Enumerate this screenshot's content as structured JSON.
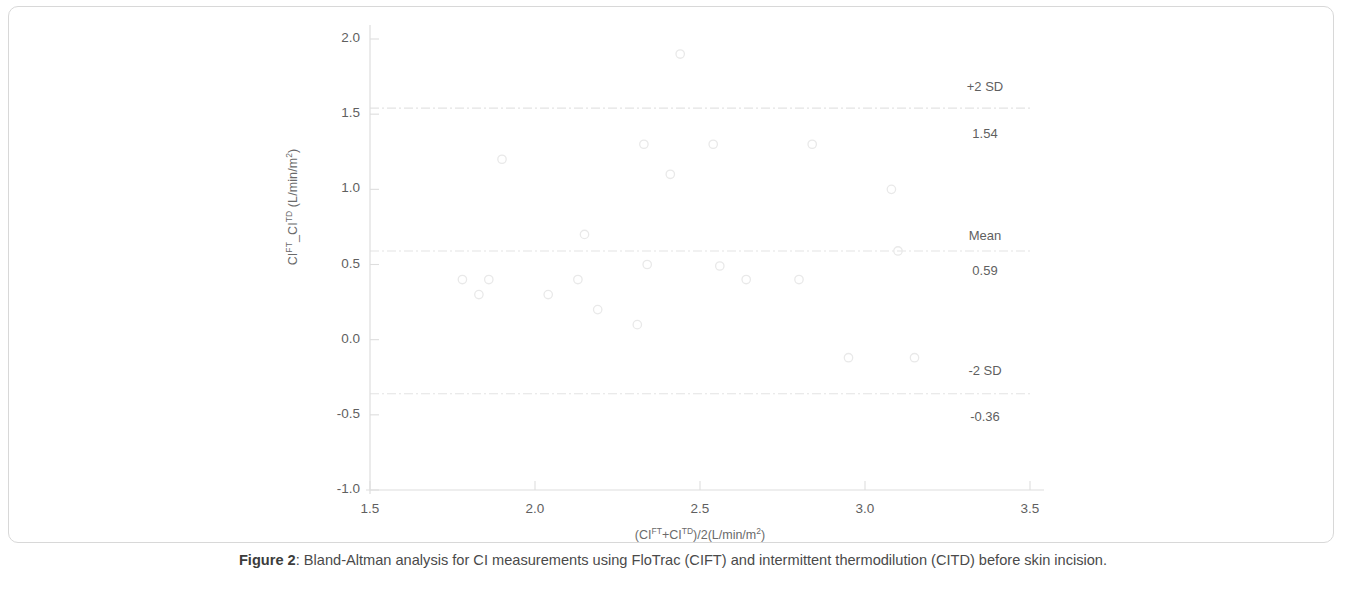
{
  "figure": {
    "caption_bold": "Figure 2",
    "caption_rest": ": Bland-Altman analysis for CI measurements using FloTrac (CIFT) and intermittent thermodilution (CITD) before skin incision."
  },
  "annotations": {
    "upper_label": "+2 SD",
    "upper_value": "1.54",
    "mean_label": "Mean",
    "mean_value": "0.59",
    "lower_label": "-2 SD",
    "lower_value": "-0.36"
  },
  "axis": {
    "y_ticks": [
      "2.0",
      "1.5",
      "1.0",
      "0.5",
      "0.0",
      "-0.5",
      "-1.0"
    ],
    "x_ticks": [
      "1.5",
      "2.0",
      "2.5",
      "3.0",
      "3.5"
    ]
  },
  "colors": {
    "marker_stroke": "#e9e9e9",
    "reference_line": "#e4e4e4",
    "axis_line": "#dedede",
    "text": "#5f5f5f"
  },
  "chart_data": {
    "type": "scatter",
    "title": "",
    "xlabel": "(CIᵀᵀ+CIᵀᴰ)/2(L/min/m2)",
    "xlabel_parts": [
      "(CI",
      "FT",
      "+CI",
      "TD",
      ")/2(L/min/m",
      "2",
      ")"
    ],
    "ylabel_parts": [
      "CI",
      "FT",
      "_CI",
      "TD",
      " (L/min/m",
      "2",
      ")"
    ],
    "xlim": [
      1.5,
      3.5
    ],
    "ylim": [
      -1.0,
      2.0
    ],
    "x_tick_values": [
      1.5,
      2.0,
      2.5,
      3.0,
      3.5
    ],
    "y_tick_values": [
      2.0,
      1.5,
      1.0,
      0.5,
      0.0,
      -0.5,
      -1.0
    ],
    "grid": false,
    "legend": "none",
    "marker": "open-circle",
    "reference_lines": [
      {
        "name": "+2 SD",
        "value": 1.54
      },
      {
        "name": "Mean",
        "value": 0.59
      },
      {
        "name": "-2 SD",
        "value": -0.36
      }
    ],
    "points": [
      {
        "x": 1.78,
        "y": 0.4
      },
      {
        "x": 1.83,
        "y": 0.3
      },
      {
        "x": 1.86,
        "y": 0.4
      },
      {
        "x": 1.9,
        "y": 1.2
      },
      {
        "x": 2.04,
        "y": 0.3
      },
      {
        "x": 2.13,
        "y": 0.4
      },
      {
        "x": 2.15,
        "y": 0.7
      },
      {
        "x": 2.19,
        "y": 0.2
      },
      {
        "x": 2.31,
        "y": 0.1
      },
      {
        "x": 2.33,
        "y": 1.3
      },
      {
        "x": 2.34,
        "y": 0.5
      },
      {
        "x": 2.41,
        "y": 1.1
      },
      {
        "x": 2.44,
        "y": 1.9
      },
      {
        "x": 2.54,
        "y": 1.3
      },
      {
        "x": 2.56,
        "y": 0.49
      },
      {
        "x": 2.64,
        "y": 0.4
      },
      {
        "x": 2.8,
        "y": 0.4
      },
      {
        "x": 2.84,
        "y": 1.3
      },
      {
        "x": 2.95,
        "y": -0.12
      },
      {
        "x": 3.08,
        "y": 1.0
      },
      {
        "x": 3.1,
        "y": 0.59
      },
      {
        "x": 3.15,
        "y": -0.12
      }
    ]
  }
}
